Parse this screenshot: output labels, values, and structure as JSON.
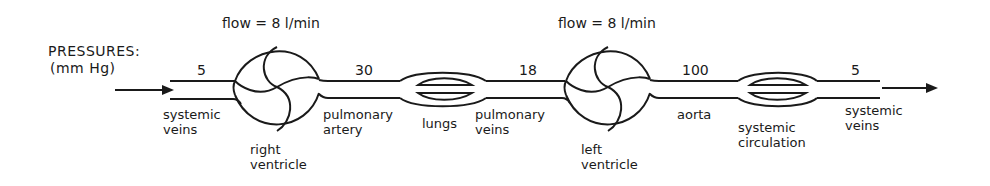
{
  "header": {
    "pressures_title": "PRESSURES:",
    "pressures_unit": "(mm Hg)"
  },
  "flows": [
    {
      "label": "flow = 8 l/min",
      "over": "right ventricle"
    },
    {
      "label": "flow = 8 l/min",
      "over": "left ventricle"
    }
  ],
  "pressures": [
    {
      "segment": "systemic veins (in)",
      "value": "5"
    },
    {
      "segment": "pulmonary artery",
      "value": "30"
    },
    {
      "segment": "pulmonary veins",
      "value": "18"
    },
    {
      "segment": "aorta",
      "value": "100"
    },
    {
      "segment": "systemic veins (out)",
      "value": "5"
    }
  ],
  "labels": {
    "systemic_veins_in": [
      "systemic",
      "veins"
    ],
    "right_ventricle": [
      "right",
      "ventricle"
    ],
    "pulmonary_artery": [
      "pulmonary",
      "artery"
    ],
    "lungs": [
      "lungs"
    ],
    "pulmonary_veins": [
      "pulmonary",
      "veins"
    ],
    "left_ventricle": [
      "left",
      "ventricle"
    ],
    "aorta": [
      "aorta"
    ],
    "systemic_circulation": [
      "systemic",
      "circulation"
    ],
    "systemic_veins_out": [
      "systemic",
      "veins"
    ]
  },
  "icons": {
    "inflow": "arrow-right-icon",
    "outflow": "arrow-right-icon",
    "pump": "ventricle-pump-icon",
    "capillary_bed": "capillary-bed-icon"
  },
  "colors": {
    "stroke": "#1a1a1a",
    "background": "#ffffff"
  }
}
